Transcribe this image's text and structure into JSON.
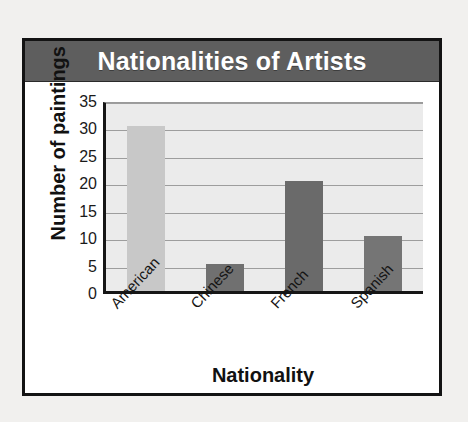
{
  "page": {
    "background_color": "#f1f0ee",
    "top_bleed_text": "· ·   ·   ·"
  },
  "figure": {
    "title": "Nationalities of Artists",
    "title_banner_color": "#5e5e5e",
    "title_text_color": "#ffffff",
    "border_color": "#131313",
    "card_background": "#ffffff"
  },
  "chart_data": {
    "type": "bar",
    "title": "Nationalities of Artists",
    "xlabel": "Nationality",
    "ylabel": "Number of paintings",
    "categories": [
      "American",
      "Chinese",
      "French",
      "Spanish"
    ],
    "values": [
      30,
      5,
      20,
      10
    ],
    "ylim": [
      0,
      35
    ],
    "ytick_step": 5,
    "yticks": [
      35,
      30,
      25,
      20,
      15,
      10,
      5,
      0
    ],
    "grid": true,
    "grid_orientation": "horizontal",
    "grid_color": "#9d9d9d",
    "legend": false,
    "plot_background": "#ebebeb",
    "axis_color": "#161616",
    "xtick_rotation_deg": -47,
    "bar_colors": [
      "#c8c8c8",
      "#707070",
      "#6a6a6a",
      "#757575"
    ],
    "bars": [
      {
        "category": "American",
        "value": 30,
        "color": "#c8c8c8"
      },
      {
        "category": "Chinese",
        "value": 5,
        "color": "#707070"
      },
      {
        "category": "French",
        "value": 20,
        "color": "#6a6a6a"
      },
      {
        "category": "Spanish",
        "value": 10,
        "color": "#757575"
      }
    ]
  }
}
